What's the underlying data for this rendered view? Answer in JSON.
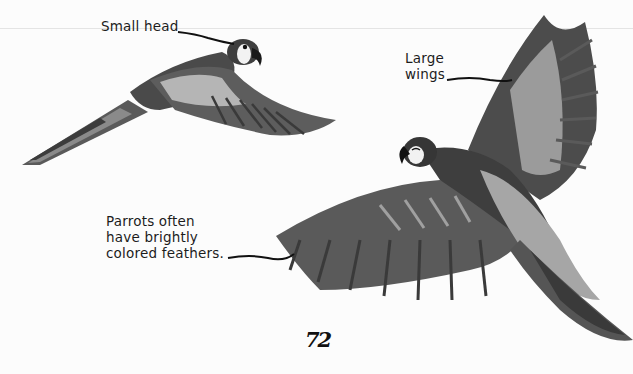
{
  "page": {
    "page_number": "72",
    "background_color": "#fcfcfc"
  },
  "labels": {
    "small_head": "Small head",
    "large_wings": "Large\nwings",
    "parrots_feathers": "Parrots often\nhave brightly\ncolored feathers."
  },
  "illustrations": [
    {
      "name": "parrot-flying-side",
      "description": "Parrot flying left with long tail, small head pointed right"
    },
    {
      "name": "parrot-flying-spread",
      "description": "Parrot with large spread wings viewed from above"
    }
  ],
  "colors": {
    "text": "#1c1c1c",
    "feather_dark": "#3a3a3a",
    "feather_mid": "#6e6e6e",
    "feather_light": "#a8a8a8",
    "eye_patch": "#f2f2f2"
  }
}
